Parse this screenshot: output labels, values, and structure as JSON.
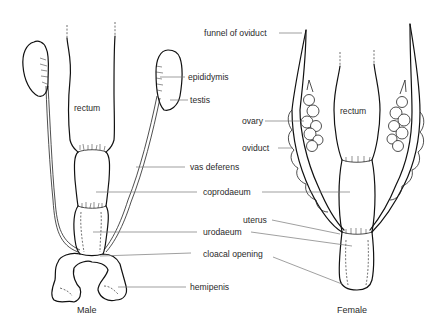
{
  "figure": {
    "panels": [
      {
        "id": "male",
        "caption": "Male"
      },
      {
        "id": "female",
        "caption": "Female"
      }
    ]
  },
  "labels": {
    "male_rectum": "rectum",
    "female_rectum": "rectum",
    "funnel_of_oviduct": "funnel of oviduct",
    "epididymis": "epididymis",
    "testis": "testis",
    "ovary": "ovary",
    "oviduct": "oviduct",
    "vas_deferens": "vas deferens",
    "coprodaeum": "coprodaeum",
    "uterus": "uterus",
    "urodaeum": "urodaeum",
    "cloacal_opening": "cloacal opening",
    "hemipenis": "hemipenis"
  },
  "colors": {
    "ink": "#111111",
    "leader": "#777777",
    "text": "#2a2a2a",
    "background": "#ffffff"
  }
}
